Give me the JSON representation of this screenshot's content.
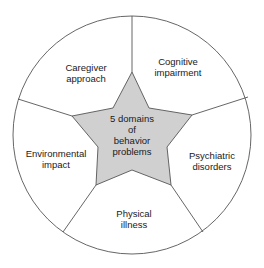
{
  "diagram": {
    "type": "circular-segmented-star",
    "center": {
      "lines": [
        "5 domains",
        "of",
        "behavior",
        "problems"
      ],
      "fill": "#d0d0d0"
    },
    "segments": [
      {
        "id": "cognitive",
        "lines": [
          "Cognitive",
          "impairment"
        ]
      },
      {
        "id": "psychiatric",
        "lines": [
          "Psychiatric",
          "disorders"
        ]
      },
      {
        "id": "physical",
        "lines": [
          "Physical",
          "illness"
        ]
      },
      {
        "id": "environmental",
        "lines": [
          "Environmental",
          "impact"
        ]
      },
      {
        "id": "caregiver",
        "lines": [
          "Caregiver",
          "approach"
        ]
      }
    ],
    "stroke": "#555555",
    "background": "#ffffff"
  }
}
